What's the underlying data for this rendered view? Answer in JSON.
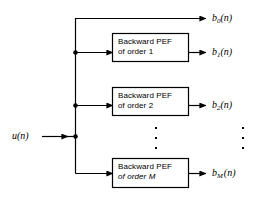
{
  "figure": {
    "type": "block-diagram",
    "title": "",
    "background_color": "#ffffff",
    "line_color": "#000000"
  },
  "input": {
    "label_var": "u",
    "label_arg": "(n)",
    "label_full": "u(n)"
  },
  "blocks": [
    {
      "id": "block-order-1",
      "line1": "Backward PEF",
      "line2": "of order 1",
      "order": "1"
    },
    {
      "id": "block-order-2",
      "line1": "Backward PEF",
      "line2": "of order 2",
      "order": "2"
    },
    {
      "id": "block-order-M",
      "line1": "Backward PEF",
      "line2": "of order M",
      "order": "M"
    }
  ],
  "outputs": [
    {
      "id": "output-b0",
      "var": "b",
      "sub": "0",
      "arg": "(n)",
      "label_full": "b0(n)"
    },
    {
      "id": "output-b1",
      "var": "b",
      "sub": "1",
      "arg": "(n)",
      "label_full": "b1(n)"
    },
    {
      "id": "output-b2",
      "var": "b",
      "sub": "2",
      "arg": "(n)",
      "label_full": "b2(n)"
    },
    {
      "id": "output-bM",
      "var": "b",
      "sub": "M",
      "arg": "(n)",
      "label_full": "bM(n)"
    }
  ],
  "ellipsis": {
    "dots": "vertical-three-dots",
    "count": 3
  }
}
